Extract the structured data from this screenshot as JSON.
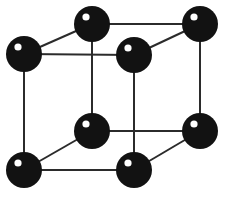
{
  "figure": {
    "kind": "crystal-lattice-diagram",
    "background_color": "#ffffff",
    "width": 226,
    "height": 197
  },
  "style": {
    "edge_color": "#2b2b2b",
    "edge_width": 2,
    "atom_color": "#121212",
    "atom_highlight_color": "#ffffff",
    "atom_radius": 18,
    "highlight_radius": 3.6,
    "highlight_offset_x": -6,
    "highlight_offset_y": -7
  },
  "vertices": [
    {
      "id": "back-top-left",
      "label": "back top left",
      "x": 92,
      "y": 24
    },
    {
      "id": "back-top-right",
      "label": "back top right",
      "x": 200,
      "y": 24
    },
    {
      "id": "front-top-left",
      "label": "front top left",
      "x": 24,
      "y": 54
    },
    {
      "id": "front-top-right",
      "label": "front top right",
      "x": 134,
      "y": 55
    },
    {
      "id": "back-bottom-left",
      "label": "back bottom left",
      "x": 92,
      "y": 131
    },
    {
      "id": "back-bottom-right",
      "label": "back bottom right",
      "x": 200,
      "y": 131
    },
    {
      "id": "front-bottom-left",
      "label": "front bottom left",
      "x": 24,
      "y": 170
    },
    {
      "id": "front-bottom-right",
      "label": "front bottom right",
      "x": 134,
      "y": 170
    }
  ],
  "edges": [
    {
      "id": "top-back",
      "from": "back-top-left",
      "to": "back-top-right"
    },
    {
      "id": "top-front",
      "from": "front-top-left",
      "to": "front-top-right"
    },
    {
      "id": "top-left-diagonal",
      "from": "front-top-left",
      "to": "back-top-left"
    },
    {
      "id": "top-right-diagonal",
      "from": "front-top-right",
      "to": "back-top-right"
    },
    {
      "id": "bottom-back",
      "from": "back-bottom-left",
      "to": "back-bottom-right"
    },
    {
      "id": "bottom-front",
      "from": "front-bottom-left",
      "to": "front-bottom-right"
    },
    {
      "id": "bottom-left-diagonal",
      "from": "front-bottom-left",
      "to": "back-bottom-left"
    },
    {
      "id": "bottom-right-diagonal",
      "from": "front-bottom-right",
      "to": "back-bottom-right"
    },
    {
      "id": "vertical-front-left",
      "from": "front-top-left",
      "to": "front-bottom-left"
    },
    {
      "id": "vertical-back-left",
      "from": "back-top-left",
      "to": "back-bottom-left"
    },
    {
      "id": "vertical-front-right",
      "from": "front-top-right",
      "to": "front-bottom-right"
    },
    {
      "id": "vertical-back-right",
      "from": "back-top-right",
      "to": "back-bottom-right"
    }
  ]
}
